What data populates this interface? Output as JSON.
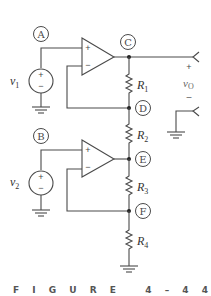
{
  "figure": {
    "caption": "FIGURE 4-44",
    "caption_display": "F I G U R E   4 – 4 4"
  },
  "nodes": [
    {
      "id": "A",
      "label": "A"
    },
    {
      "id": "B",
      "label": "B"
    },
    {
      "id": "C",
      "label": "C"
    },
    {
      "id": "D",
      "label": "D"
    },
    {
      "id": "E",
      "label": "E"
    },
    {
      "id": "F",
      "label": "F"
    }
  ],
  "sources": [
    {
      "name": "v",
      "sub": "1",
      "plus": "+",
      "minus": "−"
    },
    {
      "name": "v",
      "sub": "2",
      "plus": "+",
      "minus": "−"
    }
  ],
  "resistors": [
    {
      "name": "R",
      "sub": "1"
    },
    {
      "name": "R",
      "sub": "2"
    },
    {
      "name": "R",
      "sub": "3"
    },
    {
      "name": "R",
      "sub": "4"
    }
  ],
  "opamps": [
    {
      "plus": "+",
      "minus": "−"
    },
    {
      "plus": "+",
      "minus": "−"
    }
  ],
  "output": {
    "name": "v",
    "sub": "O",
    "plus": "+",
    "minus": "–"
  },
  "colors": {
    "line": "#4a4a4a",
    "background": "#ffffff"
  }
}
